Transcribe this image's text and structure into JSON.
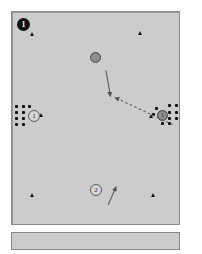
{
  "figure": {
    "background_color": "#ffffff",
    "panel_fill": "#cccccc",
    "panel_border": "#8a8a8a",
    "accent_dark": "#111111",
    "accent_gray": "#8f8f8f"
  },
  "panels": {
    "main_label": "main-simulation-panel",
    "lower_label": "lower-status-strip"
  },
  "badges": [
    {
      "id": "badge-1-filled",
      "text": "1",
      "style": "filled",
      "x": 16,
      "y": 17
    },
    {
      "id": "badge-1-open",
      "text": "1",
      "style": "open",
      "x": 27,
      "y": 108
    },
    {
      "id": "badge-2-open",
      "text": "2",
      "style": "open",
      "x": 89,
      "y": 183
    }
  ],
  "discs": [
    {
      "id": "disc-center",
      "text": "",
      "x": 89,
      "y": 51,
      "kind": "plain"
    },
    {
      "id": "disc-right",
      "text": "1",
      "x": 157,
      "y": 109,
      "kind": "numbered"
    }
  ],
  "triangles": [
    {
      "id": "tri-top-left",
      "x": 29,
      "y": 30,
      "size": "sm"
    },
    {
      "id": "tri-top-right",
      "x": 137,
      "y": 29,
      "size": "sm"
    },
    {
      "id": "tri-left-cluster",
      "x": 38,
      "y": 111,
      "size": "sm"
    },
    {
      "id": "tri-right-cluster",
      "x": 148,
      "y": 112,
      "size": "sm"
    },
    {
      "id": "tri-bottom-left",
      "x": 29,
      "y": 191,
      "size": "sm"
    },
    {
      "id": "tri-bottom-right",
      "x": 150,
      "y": 191,
      "size": "sm"
    }
  ],
  "dot_clusters": [
    {
      "id": "dot-cluster-left",
      "dots": [
        {
          "x": 14,
          "y": 104
        },
        {
          "x": 21,
          "y": 104
        },
        {
          "x": 14,
          "y": 110
        },
        {
          "x": 21,
          "y": 110
        },
        {
          "x": 14,
          "y": 116
        },
        {
          "x": 21,
          "y": 116
        },
        {
          "x": 14,
          "y": 121
        },
        {
          "x": 21,
          "y": 121
        },
        {
          "x": 27,
          "y": 104
        }
      ]
    },
    {
      "id": "dot-cluster-right",
      "dots": [
        {
          "x": 168,
          "y": 103
        },
        {
          "x": 175,
          "y": 103
        },
        {
          "x": 168,
          "y": 110
        },
        {
          "x": 175,
          "y": 110
        },
        {
          "x": 168,
          "y": 116
        },
        {
          "x": 175,
          "y": 116
        },
        {
          "x": 161,
          "y": 121
        },
        {
          "x": 168,
          "y": 121
        },
        {
          "x": 155,
          "y": 106
        },
        {
          "x": 152,
          "y": 112
        }
      ]
    }
  ],
  "arrows": [
    {
      "id": "arrow-center-solid",
      "style": "solid",
      "x1": 95,
      "y1": 63,
      "x2": 99,
      "y2": 86,
      "color": "#5a5a5a"
    },
    {
      "id": "arrow-goal-dashed",
      "style": "dashed",
      "x1": 154,
      "y1": 111,
      "x2": 102,
      "y2": 87,
      "color": "#5a5a5a"
    },
    {
      "id": "arrow-bottom-solid",
      "style": "solid",
      "x1": 95,
      "y1": 182,
      "x2": 102,
      "y2": 166,
      "color": "#5a5a5a"
    }
  ]
}
